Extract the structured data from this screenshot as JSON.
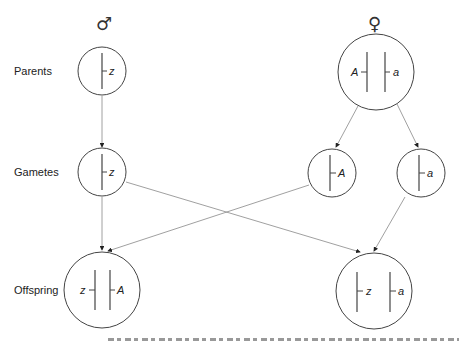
{
  "symbols": {
    "male": "♂",
    "female": "♀"
  },
  "row_labels": {
    "parents": "Parents",
    "gametes": "Gametes",
    "offspring": "Offspring"
  },
  "male_parent": {
    "alleles": [
      "z"
    ]
  },
  "female_parent": {
    "alleles": [
      "A",
      "a"
    ]
  },
  "gametes": [
    {
      "id": "male-gamete",
      "allele": "z"
    },
    {
      "id": "female-gamete-A",
      "allele": "A"
    },
    {
      "id": "female-gamete-a",
      "allele": "a"
    }
  ],
  "offspring": [
    {
      "id": "offspring-left",
      "alleles": [
        "z",
        "A"
      ]
    },
    {
      "id": "offspring-right",
      "alleles": [
        "z",
        "a"
      ]
    }
  ],
  "colors": {
    "line": "#444444",
    "arrow_line": "#888888",
    "text": "#222222"
  }
}
